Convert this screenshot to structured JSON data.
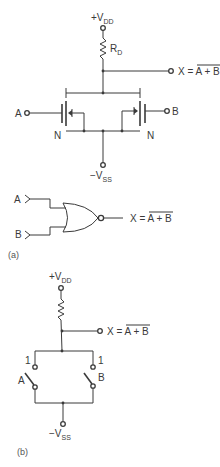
{
  "figure_a": {
    "supply_top": {
      "prefix": "+V",
      "sub": "DD"
    },
    "resistor": {
      "name": "R",
      "sub": "D"
    },
    "output": {
      "label": "X = ",
      "expr": "A + B"
    },
    "input_a": "A",
    "input_b": "B",
    "transistor_left_type": "N",
    "transistor_right_type": "N",
    "supply_bottom": {
      "prefix": "−V",
      "sub": "SS"
    },
    "gate": {
      "type": "NOR",
      "input_a": "A",
      "input_b": "B",
      "output": {
        "label": "X = ",
        "expr": "A + B"
      }
    },
    "caption": "(a)"
  },
  "figure_b": {
    "supply_top": {
      "prefix": "+V",
      "sub": "DD"
    },
    "output": {
      "label": "X = ",
      "expr": "A + B"
    },
    "switch_a": {
      "label": "A",
      "state_label": "1"
    },
    "switch_b": {
      "label": "B",
      "state_label": "1"
    },
    "supply_bottom": {
      "prefix": "−V",
      "sub": "SS"
    },
    "caption": "(b)"
  }
}
